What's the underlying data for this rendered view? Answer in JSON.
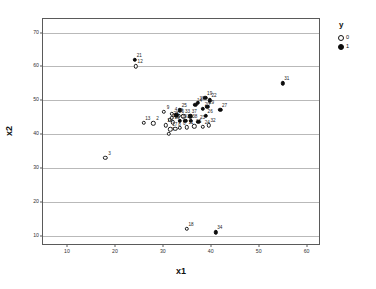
{
  "chart_data": {
    "type": "scatter",
    "title": "",
    "xlabel": "x1",
    "ylabel": "x2",
    "xlim": [
      5,
      63
    ],
    "ylim": [
      7,
      74
    ],
    "xticks": [
      10,
      20,
      30,
      40,
      50,
      60
    ],
    "yticks": [
      10,
      20,
      30,
      40,
      50,
      60,
      70
    ],
    "grid": "horizontal",
    "legend": {
      "title": "y",
      "position": "right-top",
      "entries": [
        {
          "label": "0",
          "marker": "open-circle"
        },
        {
          "label": "1",
          "marker": "filled-circle"
        }
      ]
    },
    "series": [
      {
        "name": "0",
        "marker": "open-circle",
        "points": [
          {
            "label": "1",
            "x": 31.4,
            "y": 44.3
          },
          {
            "label": "2",
            "x": 28.0,
            "y": 43.2
          },
          {
            "label": "3",
            "x": 18.0,
            "y": 33.0
          },
          {
            "label": "4",
            "x": 31.9,
            "y": 46.0
          },
          {
            "label": "5",
            "x": 33.3,
            "y": 45.4
          },
          {
            "label": "6",
            "x": 33.6,
            "y": 41.8
          },
          {
            "label": "7",
            "x": 31.3,
            "y": 40.2
          },
          {
            "label": "8",
            "x": 32.6,
            "y": 41.6
          },
          {
            "label": "9",
            "x": 30.2,
            "y": 46.6
          },
          {
            "label": "10",
            "x": 32.1,
            "y": 43.5
          },
          {
            "label": "11",
            "x": 35.0,
            "y": 42.0
          },
          {
            "label": "12",
            "x": 24.4,
            "y": 60.0
          },
          {
            "label": "13",
            "x": 26.0,
            "y": 43.4
          },
          {
            "label": "15",
            "x": 36.6,
            "y": 42.3
          },
          {
            "label": "16",
            "x": 30.6,
            "y": 42.6
          },
          {
            "label": "17",
            "x": 31.6,
            "y": 41.4
          },
          {
            "label": "18",
            "x": 35.0,
            "y": 12.0
          },
          {
            "label": "24",
            "x": 38.4,
            "y": 42.1
          },
          {
            "label": "28",
            "x": 31.9,
            "y": 44.8
          },
          {
            "label": "32",
            "x": 39.6,
            "y": 42.6
          },
          {
            "label": "33",
            "x": 34.3,
            "y": 45.3
          }
        ]
      },
      {
        "name": "1",
        "marker": "filled-circle",
        "points": [
          {
            "label": "14",
            "x": 36.8,
            "y": 48.6
          },
          {
            "label": "19",
            "x": 38.9,
            "y": 50.8
          },
          {
            "label": "20",
            "x": 38.4,
            "y": 47.5
          },
          {
            "label": "21",
            "x": 24.2,
            "y": 62.0
          },
          {
            "label": "22",
            "x": 39.8,
            "y": 50.0
          },
          {
            "label": "23",
            "x": 37.4,
            "y": 43.7
          },
          {
            "label": "25",
            "x": 33.6,
            "y": 47.1
          },
          {
            "label": "26",
            "x": 39.0,
            "y": 45.5
          },
          {
            "label": "27",
            "x": 42.0,
            "y": 47.2
          },
          {
            "label": "29",
            "x": 39.3,
            "y": 48.0
          },
          {
            "label": "30",
            "x": 37.3,
            "y": 49.2
          },
          {
            "label": "31",
            "x": 55.0,
            "y": 55.0
          },
          {
            "label": "34",
            "x": 41.0,
            "y": 11.0
          },
          {
            "label": "35",
            "x": 32.8,
            "y": 45.6
          },
          {
            "label": "36",
            "x": 34.7,
            "y": 44.0
          },
          {
            "label": "37",
            "x": 35.7,
            "y": 45.3
          },
          {
            "label": "38",
            "x": 35.8,
            "y": 44.0
          },
          {
            "label": "39",
            "x": 33.6,
            "y": 43.9
          }
        ]
      }
    ]
  }
}
